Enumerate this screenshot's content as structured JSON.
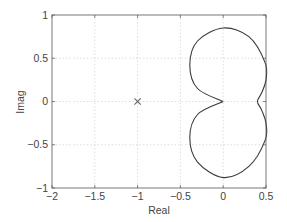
{
  "chart_data": {
    "type": "line",
    "title": "",
    "xlabel": "Real",
    "ylabel": "Imag",
    "xlim": [
      -2,
      0.5
    ],
    "ylim": [
      -1,
      1
    ],
    "grid": true,
    "legend": null,
    "x_ticks": [
      "-2",
      "-1.5",
      "-1",
      "-0.5",
      "0",
      "0.5"
    ],
    "y_ticks": [
      "-1",
      "-0.5",
      "0",
      "0.5",
      "1"
    ],
    "markers": [
      {
        "symbol": "x",
        "x": -1,
        "y": 0,
        "label": "critical point"
      }
    ],
    "series": [
      {
        "name": "Nyquist curve",
        "description": "closed curve symmetric about the real axis: two lobes meeting in a cusp at the origin, with an indentation at (0.4, 0)",
        "points": [
          [
            0,
            0
          ],
          [
            -0.3,
            0.15
          ],
          [
            -0.39,
            0.42
          ],
          [
            -0.3,
            0.7
          ],
          [
            0,
            0.85
          ],
          [
            0.3,
            0.75
          ],
          [
            0.49,
            0.45
          ],
          [
            0.5,
            0.25
          ],
          [
            0.45,
            0.1
          ],
          [
            0.4,
            0
          ],
          [
            0.45,
            -0.1
          ],
          [
            0.5,
            -0.25
          ],
          [
            0.49,
            -0.45
          ],
          [
            0.3,
            -0.75
          ],
          [
            0,
            -0.88
          ],
          [
            -0.3,
            -0.7
          ],
          [
            -0.39,
            -0.42
          ],
          [
            -0.3,
            -0.15
          ],
          [
            0,
            0
          ]
        ]
      }
    ]
  },
  "axes": {
    "xlabel": "Real",
    "ylabel": "Imag",
    "x_ticks": [
      {
        "v": -2,
        "label": "−2"
      },
      {
        "v": -1.5,
        "label": "−1.5"
      },
      {
        "v": -1,
        "label": "−1"
      },
      {
        "v": -0.5,
        "label": "−0.5"
      },
      {
        "v": 0,
        "label": "0"
      },
      {
        "v": 0.5,
        "label": "0.5"
      }
    ],
    "y_ticks": [
      {
        "v": 1,
        "label": "1"
      },
      {
        "v": 0.5,
        "label": "0.5"
      },
      {
        "v": 0,
        "label": "0"
      },
      {
        "v": -0.5,
        "label": "−0.5"
      },
      {
        "v": -1,
        "label": "−1"
      }
    ]
  },
  "colors": {
    "axis": "#555555",
    "grid": "#c8c8c8",
    "curve": "#3a3a3a",
    "marker": "#666666"
  }
}
